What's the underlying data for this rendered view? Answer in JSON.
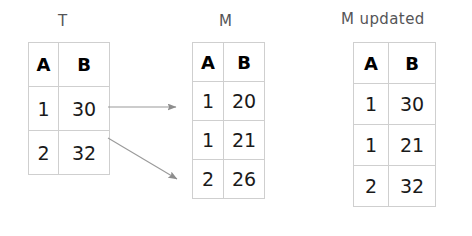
{
  "diagram": {
    "background_color": "#ffffff",
    "border_color": "#cfcfcf",
    "arrow_color": "#8d8d8d",
    "tables": [
      {
        "id": "T",
        "label": "T",
        "columns": [
          "A",
          "B"
        ],
        "rows": [
          {
            "A": "1",
            "B": "30"
          },
          {
            "A": "2",
            "B": "32"
          }
        ]
      },
      {
        "id": "M",
        "label": "M",
        "columns": [
          "A",
          "B"
        ],
        "rows": [
          {
            "A": "1",
            "B": "20"
          },
          {
            "A": "1",
            "B": "21"
          },
          {
            "A": "2",
            "B": "26"
          }
        ]
      },
      {
        "id": "Mupd",
        "label": "M updated",
        "columns": [
          "A",
          "B"
        ],
        "rows": [
          {
            "A": "1",
            "B": "30"
          },
          {
            "A": "1",
            "B": "21"
          },
          {
            "A": "2",
            "B": "32"
          }
        ]
      }
    ],
    "arrows": [
      {
        "name": "arrow-row1-to-M-row1",
        "from": [
          108,
          107
        ],
        "to": [
          178,
          107
        ]
      },
      {
        "name": "arrow-row2-to-M-row3",
        "from": [
          108,
          138
        ],
        "to": [
          180,
          181
        ]
      }
    ]
  }
}
